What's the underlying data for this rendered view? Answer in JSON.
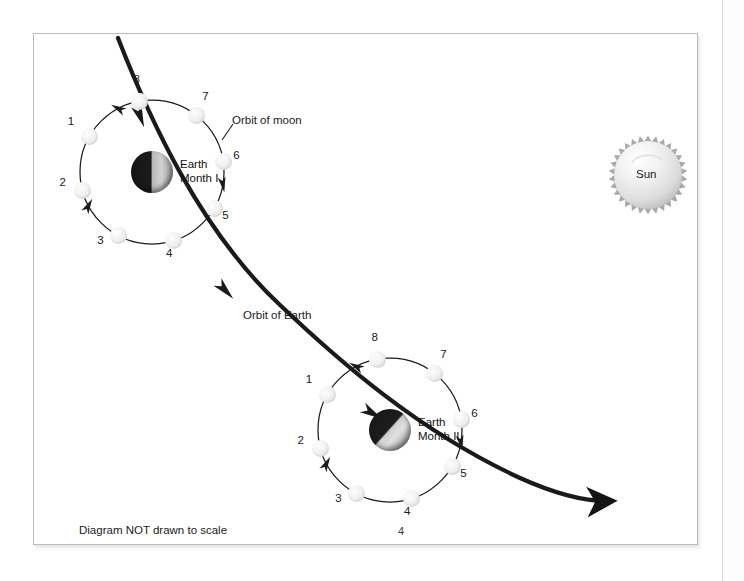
{
  "figure": {
    "caption": "Diagram NOT drawn to scale",
    "page_number": "4",
    "labels": {
      "orbit_of_moon": "Orbit of moon",
      "orbit_of_earth": "Orbit of Earth",
      "sun": "Sun"
    },
    "bodies": [
      {
        "name": "earth-month-1",
        "label_line1": "Earth",
        "label_line2": "Month I",
        "cx": 152,
        "cy": 172,
        "r": 21,
        "terminator": "vertical",
        "orbit": {
          "cx": 152,
          "cy": 172,
          "r": 72,
          "direction": "counterclockwise"
        },
        "moons": [
          {
            "num": "1",
            "angle_deg": 150,
            "label_dx": -19,
            "label_dy": -14
          },
          {
            "num": "2",
            "angle_deg": 195,
            "label_dx": -20,
            "label_dy": -8
          },
          {
            "num": "3",
            "angle_deg": 242,
            "label_dx": -18,
            "label_dy": 5
          },
          {
            "num": "4",
            "angle_deg": 287,
            "label_dx": -4,
            "label_dy": 13
          },
          {
            "num": "5",
            "angle_deg": 330,
            "label_dx": 11,
            "label_dy": 8
          },
          {
            "num": "6",
            "angle_deg": 8,
            "label_dx": 13,
            "label_dy": -6
          },
          {
            "num": "7",
            "angle_deg": 52,
            "label_dx": 9,
            "label_dy": -18
          },
          {
            "num": "8",
            "angle_deg": 100,
            "label_dx": -3,
            "label_dy": -21
          }
        ]
      },
      {
        "name": "earth-month-2",
        "label_line1": "Earth",
        "label_line2": "Month II",
        "cx": 390,
        "cy": 430,
        "r": 21,
        "terminator": "diagonal",
        "orbit": {
          "cx": 390,
          "cy": 430,
          "r": 72,
          "direction": "counterclockwise"
        },
        "moons": [
          {
            "num": "1",
            "angle_deg": 150,
            "label_dx": -19,
            "label_dy": -14
          },
          {
            "num": "2",
            "angle_deg": 195,
            "label_dx": -20,
            "label_dy": -8
          },
          {
            "num": "3",
            "angle_deg": 242,
            "label_dx": -18,
            "label_dy": 5
          },
          {
            "num": "4",
            "angle_deg": 287,
            "label_dx": -4,
            "label_dy": 13
          },
          {
            "num": "5",
            "angle_deg": 330,
            "label_dx": 11,
            "label_dy": 8
          },
          {
            "num": "6",
            "angle_deg": 8,
            "label_dx": 13,
            "label_dy": -6
          },
          {
            "num": "7",
            "angle_deg": 52,
            "label_dx": 9,
            "label_dy": -18
          },
          {
            "num": "8",
            "angle_deg": 100,
            "label_dx": -3,
            "label_dy": -21
          }
        ]
      }
    ],
    "sun": {
      "cx": 648,
      "cy": 175,
      "r": 34,
      "spikes": 30,
      "label": "Sun"
    },
    "earth_orbit_path": "M 118 38 C 150 120, 200 230, 280 305 C 340 362, 420 432, 520 478 C 560 496, 590 502, 612 501",
    "colors": {
      "line": "#1a1a1a",
      "frame": "#b9b9b9",
      "background": "#ffffff",
      "moon": "#f0f0f0",
      "sun": "#e9e9e9",
      "text": "#1a1a1a"
    }
  }
}
